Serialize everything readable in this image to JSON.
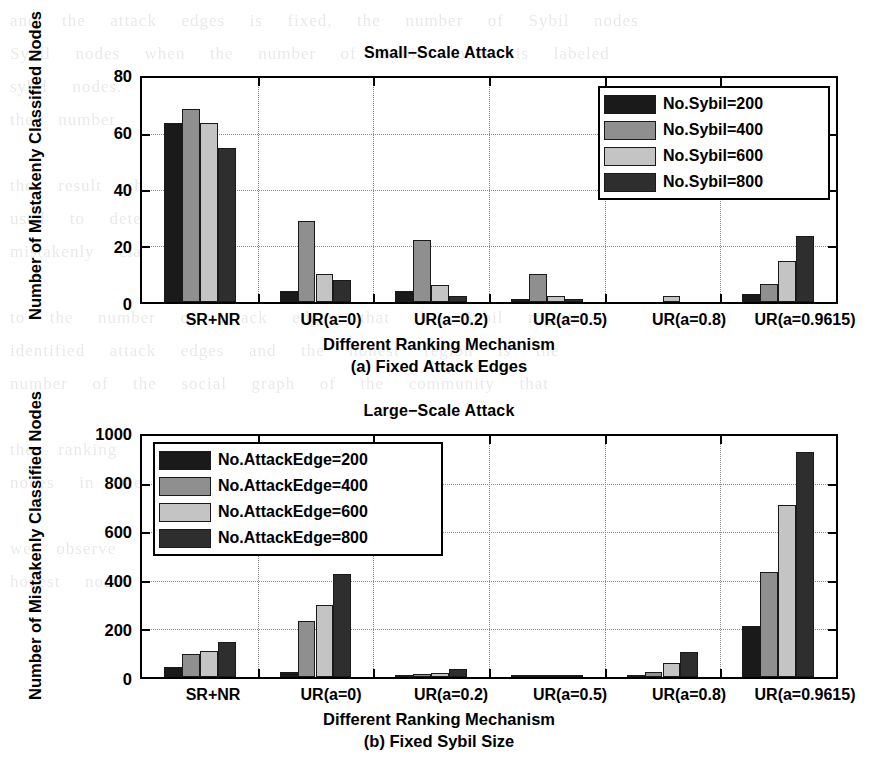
{
  "figure": {
    "xlabel": "Different Ranking Mechanism",
    "ylabel": "Number of Mistakenly Classified Nodes",
    "caption_a": "(a) Fixed Attack Edges",
    "caption_b": "(b) Fixed Sybil Size"
  },
  "series_colors": [
    "#1a1a1a",
    "#8f8f8f",
    "#c4c4c4",
    "#2e2e2e"
  ],
  "chart_data": [
    {
      "type": "bar",
      "title": "Small−Scale Attack",
      "xlabel": "Different Ranking Mechanism",
      "ylabel": "Number of Mistakenly Classified Nodes",
      "categories": [
        "SR+NR",
        "UR(a=0)",
        "UR(a=0.2)",
        "UR(a=0.5)",
        "UR(a=0.8)",
        "UR(a=0.9615)"
      ],
      "yticks": [
        0,
        20,
        40,
        60,
        80
      ],
      "ylim": [
        0,
        80
      ],
      "grid": true,
      "legend_position": "upper right",
      "series": [
        {
          "name": "No.Sybil=200",
          "values": [
            64,
            4,
            4,
            1,
            0,
            3
          ]
        },
        {
          "name": "No.Sybil=400",
          "values": [
            69,
            29,
            22,
            10,
            0,
            6.5
          ]
        },
        {
          "name": "No.Sybil=600",
          "values": [
            64,
            10,
            6,
            2,
            2,
            14.5
          ]
        },
        {
          "name": "No.Sybil=800",
          "values": [
            55,
            8,
            2,
            1,
            0,
            23.5
          ]
        }
      ]
    },
    {
      "type": "bar",
      "title": "Large−Scale Attack",
      "xlabel": "Different Ranking Mechanism",
      "ylabel": "Number of Mistakenly Classified Nodes",
      "categories": [
        "SR+NR",
        "UR(a=0)",
        "UR(a=0.2)",
        "UR(a=0.5)",
        "UR(a=0.8)",
        "UR(a=0.9615)"
      ],
      "yticks": [
        0,
        200,
        400,
        600,
        800,
        1000
      ],
      "ylim": [
        0,
        1000
      ],
      "grid": true,
      "legend_position": "upper left",
      "series": [
        {
          "name": "No.AttackEdge=200",
          "values": [
            42,
            22,
            3,
            2,
            9,
            210
          ]
        },
        {
          "name": "No.AttackEdge=400",
          "values": [
            95,
            232,
            12,
            7,
            22,
            437
          ]
        },
        {
          "name": "No.AttackEdge=600",
          "values": [
            108,
            298,
            15,
            4,
            58,
            713
          ]
        },
        {
          "name": "No.AttackEdge=800",
          "values": [
            147,
            428,
            35,
            10,
            105,
            935
          ]
        }
      ]
    }
  ],
  "bleed_text": "and  the  attack  edges  is  fixed,  the  number  of  Sybil  nodes\nSybil  nodes  when  the  number  of  Sybil  nodes  is  labeled\nsybil  nodes.  Even  when  the  attack  edges  to  the  number  of\nthe  number  of  the  last  mechanism  is  relatively  small\n\nthe  result  shows  that  the  ranking  mechanism  can  be\nused  to  detect  the  Sybil  nodes  in  a  social  network  with\nmistakenly  classified  nodes.  The  number  of  nodes\n\nto  the  number  of  attack  edges  that  the  Sybil  region\nidentified  attack  edges  and  the  honest  region  is  the\nnumber  of  the  social  graph  of  the  community  that\n\nthe  ranking  mechanism  is  able  to  identify  most  of  the\nnodes  in  the  network.  In  the  experiment  we\n\nwe  observe  the  number  of  the  mistakenly  classified\nhonest  nodes  that  are  the  same  as  the  attack  edges"
}
